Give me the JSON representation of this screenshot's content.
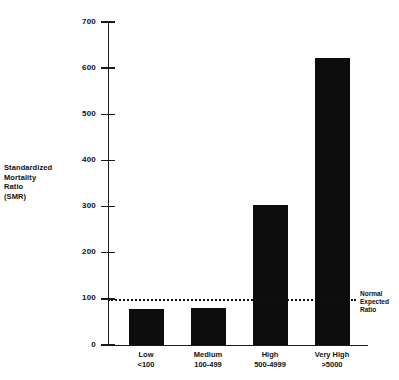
{
  "chart_data": {
    "type": "bar",
    "title": "",
    "xlabel": "",
    "ylabel": "Standardized Mortality Ratio (SMR)",
    "ylabel_lines": [
      "Standardized",
      "Mortality",
      "Ratio",
      "(SMR)"
    ],
    "categories": [
      "Low",
      "Medium",
      "High",
      "Very High"
    ],
    "category_sublabels": [
      "<100",
      "100-499",
      "500-4999",
      ">5000"
    ],
    "values": [
      78,
      80,
      303,
      622
    ],
    "ylim": [
      0,
      700
    ],
    "yticks": [
      0,
      100,
      200,
      300,
      400,
      500,
      600,
      700
    ],
    "ytick_labels": [
      "0",
      "100",
      "200",
      "300",
      "400",
      "500",
      "600",
      "700"
    ],
    "grid": false,
    "legend": null,
    "bar_color": "#0d0d0d",
    "axis_color": "#1a1a1a",
    "annotations": [
      {
        "name": "normal-expected-ratio",
        "value": 100,
        "style": "dotted-horizontal-line",
        "lines": [
          "Normal",
          "Expected",
          "Ratio"
        ]
      }
    ]
  }
}
